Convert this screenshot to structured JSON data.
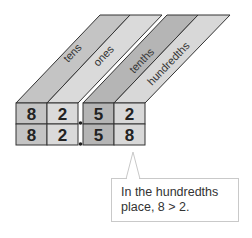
{
  "strips": [
    {
      "label": "tens",
      "fill": "#c4c4c4"
    },
    {
      "label": "ones",
      "fill": "#dadada"
    },
    {
      "label": "tenths",
      "fill": "#b5b5b5"
    },
    {
      "label": "hundredths",
      "fill": "#d8d8d8"
    }
  ],
  "rows": [
    {
      "digits": [
        "8",
        "2",
        "5",
        "2"
      ]
    },
    {
      "digits": [
        "8",
        "2",
        "5",
        "8"
      ]
    }
  ],
  "decimal_point": ".",
  "callout": {
    "line1": "In the hundredths",
    "line2": "place, 8 > 2."
  }
}
